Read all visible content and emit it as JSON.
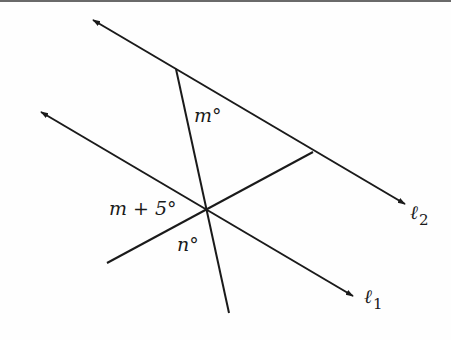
{
  "diagram": {
    "type": "geometry",
    "stroke_color": "#1a1a1a",
    "lines": {
      "l2": {
        "label": "ℓ",
        "subscript": "2",
        "from": [
          93,
          20
        ],
        "to": [
          405,
          204
        ]
      },
      "l1": {
        "label": "ℓ",
        "subscript": "1",
        "from": [
          41,
          112
        ],
        "to": [
          353,
          296
        ]
      },
      "transversal": {
        "from": [
          176,
          69
        ],
        "to": [
          229,
          313
        ]
      },
      "segment": {
        "from": [
          107,
          263
        ],
        "to": [
          313,
          152
        ]
      }
    },
    "angle_labels": {
      "top": "m°",
      "left": "m + 5°",
      "bottom": "n°"
    }
  }
}
